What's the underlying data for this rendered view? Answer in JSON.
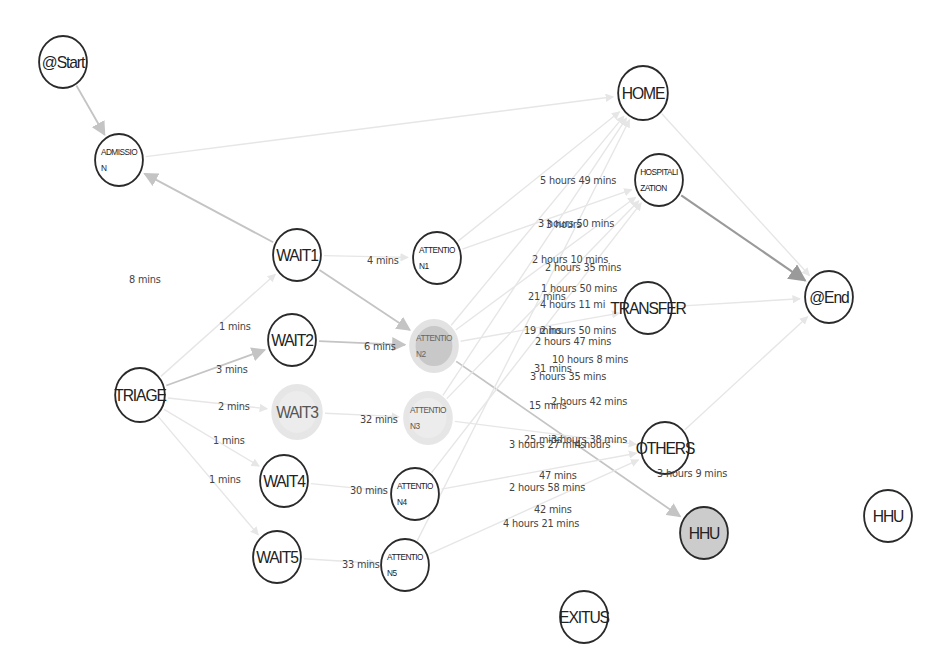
{
  "diagram": {
    "type": "process-map",
    "nodes": [
      {
        "id": "start",
        "label": "@Start",
        "x": 63,
        "y": 62,
        "r": 27,
        "style": "normal",
        "size": "big"
      },
      {
        "id": "admission",
        "label": "ADMISSIO\nN",
        "x": 119,
        "y": 160,
        "r": 27,
        "style": "normal",
        "size": "small"
      },
      {
        "id": "wait1",
        "label": "WAIT1",
        "x": 297,
        "y": 255,
        "r": 27,
        "style": "normal",
        "size": "big"
      },
      {
        "id": "attention1",
        "label": "ATTENTIO\nN1",
        "x": 437,
        "y": 258,
        "r": 27,
        "style": "normal",
        "size": "small"
      },
      {
        "id": "wait2",
        "label": "WAIT2",
        "x": 292,
        "y": 340,
        "r": 27,
        "style": "normal",
        "size": "big"
      },
      {
        "id": "attention2",
        "label": "ATTENTIO\nN2",
        "x": 434,
        "y": 346,
        "r": 27,
        "style": "dim-filled",
        "size": "small"
      },
      {
        "id": "triage",
        "label": "TRIAGE",
        "x": 140,
        "y": 395,
        "r": 28,
        "style": "normal",
        "size": "big"
      },
      {
        "id": "wait3",
        "label": "WAIT3",
        "x": 297,
        "y": 412,
        "r": 28,
        "style": "dim",
        "size": "big"
      },
      {
        "id": "attention3",
        "label": "ATTENTIO\nN3",
        "x": 428,
        "y": 418,
        "r": 27,
        "style": "dim",
        "size": "small"
      },
      {
        "id": "wait4",
        "label": "WAIT4",
        "x": 284,
        "y": 481,
        "r": 27,
        "style": "normal",
        "size": "big"
      },
      {
        "id": "attention4",
        "label": "ATTENTIO\nN4",
        "x": 415,
        "y": 494,
        "r": 27,
        "style": "normal",
        "size": "small"
      },
      {
        "id": "wait5",
        "label": "WAIT5",
        "x": 277,
        "y": 557,
        "r": 27,
        "style": "normal",
        "size": "big"
      },
      {
        "id": "attention5",
        "label": "ATTENTIO\nN5",
        "x": 405,
        "y": 565,
        "r": 27,
        "style": "normal",
        "size": "small"
      },
      {
        "id": "home",
        "label": "HOME",
        "x": 643,
        "y": 93,
        "r": 28,
        "style": "normal",
        "size": "big"
      },
      {
        "id": "hospitalization",
        "label": "HOSPITALI\nZATION",
        "x": 659,
        "y": 180,
        "r": 27,
        "style": "normal",
        "size": "small"
      },
      {
        "id": "transfer",
        "label": "TRANSFER",
        "x": 648,
        "y": 308,
        "r": 27,
        "style": "normal",
        "size": "big"
      },
      {
        "id": "end",
        "label": "@End",
        "x": 829,
        "y": 297,
        "r": 27,
        "style": "normal",
        "size": "big"
      },
      {
        "id": "others",
        "label": "OTHERS",
        "x": 665,
        "y": 448,
        "r": 27,
        "style": "normal",
        "size": "big"
      },
      {
        "id": "hhu_active",
        "label": "HHU",
        "x": 704,
        "y": 533,
        "r": 27,
        "style": "filled",
        "size": "big"
      },
      {
        "id": "hhu",
        "label": "HHU",
        "x": 888,
        "y": 516,
        "r": 27,
        "style": "normal",
        "size": "big"
      },
      {
        "id": "exitus",
        "label": "EXITUS",
        "x": 584,
        "y": 617,
        "r": 27,
        "style": "normal",
        "size": "big"
      }
    ],
    "edges": [
      {
        "from": "start",
        "to": "admission",
        "strength": "medium"
      },
      {
        "from": "wait1",
        "to": "admission",
        "strength": "medium"
      },
      {
        "from": "admission",
        "to": "home",
        "strength": "faint"
      },
      {
        "from": "triage",
        "to": "wait2",
        "strength": "medium"
      },
      {
        "from": "triage",
        "to": "wait1",
        "strength": "faint"
      },
      {
        "from": "triage",
        "to": "wait3",
        "strength": "faint"
      },
      {
        "from": "triage",
        "to": "wait4",
        "strength": "faint"
      },
      {
        "from": "triage",
        "to": "wait5",
        "strength": "faint"
      },
      {
        "from": "wait1",
        "to": "attention1",
        "strength": "faint"
      },
      {
        "from": "wait1",
        "to": "attention2",
        "strength": "medium"
      },
      {
        "from": "wait2",
        "to": "attention2",
        "strength": "medium"
      },
      {
        "from": "wait3",
        "to": "attention3",
        "strength": "faint"
      },
      {
        "from": "wait4",
        "to": "attention4",
        "strength": "faint"
      },
      {
        "from": "wait5",
        "to": "attention5",
        "strength": "faint"
      },
      {
        "from": "attention2",
        "to": "hhu_active",
        "strength": "medium"
      },
      {
        "from": "hospitalization",
        "to": "end",
        "strength": "strong"
      },
      {
        "from": "home",
        "to": "end",
        "strength": "faint"
      },
      {
        "from": "attention1",
        "to": "home",
        "strength": "faint"
      },
      {
        "from": "attention1",
        "to": "hospitalization",
        "strength": "faint"
      },
      {
        "from": "attention2",
        "to": "home",
        "strength": "faint"
      },
      {
        "from": "attention2",
        "to": "hospitalization",
        "strength": "faint"
      },
      {
        "from": "attention2",
        "to": "transfer",
        "strength": "faint"
      },
      {
        "from": "attention3",
        "to": "hospitalization",
        "strength": "faint"
      },
      {
        "from": "attention3",
        "to": "home",
        "strength": "faint"
      },
      {
        "from": "attention3",
        "to": "others",
        "strength": "faint"
      },
      {
        "from": "attention4",
        "to": "hospitalization",
        "strength": "faint"
      },
      {
        "from": "attention4",
        "to": "others",
        "strength": "faint"
      },
      {
        "from": "attention5",
        "to": "home",
        "strength": "faint"
      },
      {
        "from": "attention5",
        "to": "others",
        "strength": "faint"
      },
      {
        "from": "others",
        "to": "end",
        "strength": "faint"
      },
      {
        "from": "transfer",
        "to": "end",
        "strength": "faint"
      }
    ],
    "edge_labels": [
      {
        "text": "8 mins",
        "x": 129,
        "y": 280
      },
      {
        "text": "1 mins",
        "x": 219,
        "y": 327
      },
      {
        "text": "3 mins",
        "x": 216,
        "y": 370
      },
      {
        "text": "2 mins",
        "x": 218,
        "y": 407
      },
      {
        "text": "1 mins",
        "x": 213,
        "y": 441
      },
      {
        "text": "1 mins",
        "x": 209,
        "y": 480
      },
      {
        "text": "4 mins",
        "x": 367,
        "y": 261
      },
      {
        "text": "6 mins",
        "x": 364,
        "y": 347
      },
      {
        "text": "32 mins",
        "x": 360,
        "y": 420
      },
      {
        "text": "30 mins",
        "x": 350,
        "y": 491
      },
      {
        "text": "33 mins",
        "x": 342,
        "y": 565
      },
      {
        "text": "5 hours 49 mins",
        "x": 540,
        "y": 181
      },
      {
        "text": "3 hours 50 mins",
        "x": 538,
        "y": 224
      },
      {
        "text": "3 hours",
        "x": 546,
        "y": 225
      },
      {
        "text": "2 hours 10 mins",
        "x": 532,
        "y": 260
      },
      {
        "text": "2 hours 35 mins",
        "x": 545,
        "y": 268
      },
      {
        "text": "1 hours 50 mins",
        "x": 541,
        "y": 289
      },
      {
        "text": "21 mins",
        "x": 528,
        "y": 297
      },
      {
        "text": "4 hours 11 mi",
        "x": 540,
        "y": 305
      },
      {
        "text": "19 mins",
        "x": 524,
        "y": 331
      },
      {
        "text": "2 hours 50 mins",
        "x": 540,
        "y": 331
      },
      {
        "text": "2 hours 47 mins",
        "x": 535,
        "y": 342
      },
      {
        "text": "10 hours 8 mins",
        "x": 552,
        "y": 360
      },
      {
        "text": "31 mins",
        "x": 534,
        "y": 369
      },
      {
        "text": "3 hours 35 mins",
        "x": 530,
        "y": 377
      },
      {
        "text": "15 mins",
        "x": 529,
        "y": 406
      },
      {
        "text": "2 hours 42 mins",
        "x": 551,
        "y": 402
      },
      {
        "text": "25 mins",
        "x": 524,
        "y": 440
      },
      {
        "text": "3 hours 38 mins",
        "x": 551,
        "y": 440
      },
      {
        "text": "3 hours 27 mins",
        "x": 509,
        "y": 445
      },
      {
        "text": "4 hours",
        "x": 575,
        "y": 445
      },
      {
        "text": "3 hours 9 mins",
        "x": 657,
        "y": 474
      },
      {
        "text": "47 mins",
        "x": 539,
        "y": 476
      },
      {
        "text": "2 hours 58 mins",
        "x": 509,
        "y": 488
      },
      {
        "text": "42 mins",
        "x": 534,
        "y": 510
      },
      {
        "text": "4 hours 21 mins",
        "x": 503,
        "y": 524
      }
    ],
    "colors": {
      "node_border": "#2a2a2a",
      "node_fill": "#ffffff",
      "node_fill_active": "#cccccc",
      "node_dim_ring": "#e4e4e4",
      "edge_strong": "#9a9a9a",
      "edge_medium": "#c4c4c4",
      "edge_faint": "#e6e6e6",
      "label_text": "#444444"
    }
  }
}
